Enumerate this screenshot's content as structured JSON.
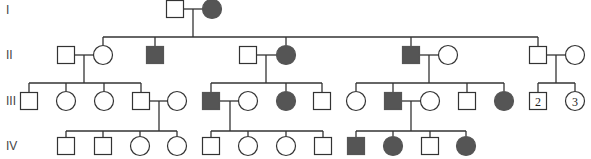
{
  "diagram": {
    "type": "pedigree",
    "colors": {
      "affected": "#555555",
      "unaffected": "#ffffff",
      "line": "#333333"
    },
    "generation_labels": [
      {
        "label": "I",
        "y": 10
      },
      {
        "label": "II",
        "y": 55
      },
      {
        "label": "III",
        "y": 101
      },
      {
        "label": "IV",
        "y": 146
      }
    ],
    "individuals": [
      {
        "id": "I-1",
        "sex": "male",
        "affected": false,
        "x": 175,
        "y": 9
      },
      {
        "id": "I-2",
        "sex": "female",
        "affected": true,
        "x": 212,
        "y": 9
      },
      {
        "id": "II-1",
        "sex": "male",
        "affected": false,
        "x": 66,
        "y": 55
      },
      {
        "id": "II-2",
        "sex": "female",
        "affected": false,
        "x": 103,
        "y": 55
      },
      {
        "id": "II-3",
        "sex": "male",
        "affected": true,
        "x": 155,
        "y": 55
      },
      {
        "id": "II-4",
        "sex": "male",
        "affected": false,
        "x": 248,
        "y": 55
      },
      {
        "id": "II-5",
        "sex": "female",
        "affected": true,
        "x": 286,
        "y": 55
      },
      {
        "id": "II-6",
        "sex": "male",
        "affected": true,
        "x": 411,
        "y": 55
      },
      {
        "id": "II-7",
        "sex": "female",
        "affected": false,
        "x": 448,
        "y": 55
      },
      {
        "id": "II-8",
        "sex": "male",
        "affected": false,
        "x": 538,
        "y": 55
      },
      {
        "id": "II-9",
        "sex": "female",
        "affected": false,
        "x": 575,
        "y": 55
      },
      {
        "id": "III-1",
        "sex": "male",
        "affected": false,
        "x": 29,
        "y": 101
      },
      {
        "id": "III-2",
        "sex": "female",
        "affected": false,
        "x": 66,
        "y": 101
      },
      {
        "id": "III-3",
        "sex": "female",
        "affected": false,
        "x": 104,
        "y": 101
      },
      {
        "id": "III-4",
        "sex": "male",
        "affected": false,
        "x": 141,
        "y": 101
      },
      {
        "id": "III-5",
        "sex": "female",
        "affected": false,
        "x": 177,
        "y": 101
      },
      {
        "id": "III-6",
        "sex": "male",
        "affected": true,
        "x": 211,
        "y": 101
      },
      {
        "id": "III-7",
        "sex": "female",
        "affected": false,
        "x": 248,
        "y": 101
      },
      {
        "id": "III-8",
        "sex": "female",
        "affected": true,
        "x": 286,
        "y": 101
      },
      {
        "id": "III-9",
        "sex": "male",
        "affected": false,
        "x": 322,
        "y": 101
      },
      {
        "id": "III-10",
        "sex": "female",
        "affected": false,
        "x": 356,
        "y": 101
      },
      {
        "id": "III-11",
        "sex": "male",
        "affected": true,
        "x": 393,
        "y": 101
      },
      {
        "id": "III-12",
        "sex": "female",
        "affected": false,
        "x": 430,
        "y": 101
      },
      {
        "id": "III-13",
        "sex": "male",
        "affected": false,
        "x": 467,
        "y": 101
      },
      {
        "id": "III-14",
        "sex": "female",
        "affected": true,
        "x": 504,
        "y": 101
      },
      {
        "id": "III-15",
        "sex": "male",
        "affected": false,
        "x": 538,
        "y": 101,
        "count": "2"
      },
      {
        "id": "III-16",
        "sex": "female",
        "affected": false,
        "x": 575,
        "y": 101,
        "count": "3"
      },
      {
        "id": "IV-1",
        "sex": "male",
        "affected": false,
        "x": 66,
        "y": 146
      },
      {
        "id": "IV-2",
        "sex": "male",
        "affected": false,
        "x": 103,
        "y": 146
      },
      {
        "id": "IV-3",
        "sex": "female",
        "affected": false,
        "x": 140,
        "y": 146
      },
      {
        "id": "IV-4",
        "sex": "female",
        "affected": false,
        "x": 177,
        "y": 146
      },
      {
        "id": "IV-5",
        "sex": "male",
        "affected": false,
        "x": 211,
        "y": 146
      },
      {
        "id": "IV-6",
        "sex": "female",
        "affected": false,
        "x": 248,
        "y": 146
      },
      {
        "id": "IV-7",
        "sex": "female",
        "affected": false,
        "x": 286,
        "y": 146
      },
      {
        "id": "IV-8",
        "sex": "male",
        "affected": false,
        "x": 323,
        "y": 146
      },
      {
        "id": "IV-9",
        "sex": "male",
        "affected": true,
        "x": 356,
        "y": 146
      },
      {
        "id": "IV-10",
        "sex": "female",
        "affected": true,
        "x": 393,
        "y": 146
      },
      {
        "id": "IV-11",
        "sex": "male",
        "affected": false,
        "x": 430,
        "y": 146
      },
      {
        "id": "IV-12",
        "sex": "female",
        "affected": true,
        "x": 466,
        "y": 146
      }
    ],
    "lines": [
      {
        "x1": 184,
        "y1": 9,
        "x2": 202,
        "y2": 9
      },
      {
        "x1": 193,
        "y1": 9,
        "x2": 193,
        "y2": 37
      },
      {
        "x1": 103,
        "y1": 37,
        "x2": 538,
        "y2": 37
      },
      {
        "x1": 103,
        "y1": 37,
        "x2": 103,
        "y2": 45
      },
      {
        "x1": 155,
        "y1": 37,
        "x2": 155,
        "y2": 46
      },
      {
        "x1": 286,
        "y1": 37,
        "x2": 286,
        "y2": 45
      },
      {
        "x1": 411,
        "y1": 37,
        "x2": 411,
        "y2": 46
      },
      {
        "x1": 538,
        "y1": 37,
        "x2": 538,
        "y2": 46
      },
      {
        "x1": 75,
        "y1": 55,
        "x2": 93,
        "y2": 55
      },
      {
        "x1": 84,
        "y1": 55,
        "x2": 84,
        "y2": 83
      },
      {
        "x1": 29,
        "y1": 83,
        "x2": 141,
        "y2": 83
      },
      {
        "x1": 29,
        "y1": 83,
        "x2": 29,
        "y2": 92
      },
      {
        "x1": 66,
        "y1": 83,
        "x2": 66,
        "y2": 91
      },
      {
        "x1": 104,
        "y1": 83,
        "x2": 104,
        "y2": 91
      },
      {
        "x1": 141,
        "y1": 83,
        "x2": 141,
        "y2": 92
      },
      {
        "x1": 257,
        "y1": 55,
        "x2": 276,
        "y2": 55
      },
      {
        "x1": 266,
        "y1": 55,
        "x2": 266,
        "y2": 83
      },
      {
        "x1": 211,
        "y1": 83,
        "x2": 322,
        "y2": 83
      },
      {
        "x1": 211,
        "y1": 83,
        "x2": 211,
        "y2": 92
      },
      {
        "x1": 286,
        "y1": 83,
        "x2": 286,
        "y2": 91
      },
      {
        "x1": 322,
        "y1": 83,
        "x2": 322,
        "y2": 92
      },
      {
        "x1": 420,
        "y1": 55,
        "x2": 438,
        "y2": 55
      },
      {
        "x1": 429,
        "y1": 55,
        "x2": 429,
        "y2": 83
      },
      {
        "x1": 356,
        "y1": 83,
        "x2": 504,
        "y2": 83
      },
      {
        "x1": 356,
        "y1": 83,
        "x2": 356,
        "y2": 91
      },
      {
        "x1": 393,
        "y1": 83,
        "x2": 393,
        "y2": 92
      },
      {
        "x1": 467,
        "y1": 83,
        "x2": 467,
        "y2": 92
      },
      {
        "x1": 504,
        "y1": 83,
        "x2": 504,
        "y2": 91
      },
      {
        "x1": 547,
        "y1": 55,
        "x2": 565,
        "y2": 55
      },
      {
        "x1": 556,
        "y1": 55,
        "x2": 556,
        "y2": 83
      },
      {
        "x1": 538,
        "y1": 83,
        "x2": 575,
        "y2": 83
      },
      {
        "x1": 538,
        "y1": 83,
        "x2": 538,
        "y2": 92
      },
      {
        "x1": 575,
        "y1": 83,
        "x2": 575,
        "y2": 91
      },
      {
        "x1": 150,
        "y1": 101,
        "x2": 167,
        "y2": 101
      },
      {
        "x1": 159,
        "y1": 101,
        "x2": 159,
        "y2": 131
      },
      {
        "x1": 66,
        "y1": 131,
        "x2": 177,
        "y2": 131
      },
      {
        "x1": 66,
        "y1": 131,
        "x2": 66,
        "y2": 137
      },
      {
        "x1": 103,
        "y1": 131,
        "x2": 103,
        "y2": 137
      },
      {
        "x1": 140,
        "y1": 131,
        "x2": 140,
        "y2": 136
      },
      {
        "x1": 177,
        "y1": 131,
        "x2": 177,
        "y2": 136
      },
      {
        "x1": 220,
        "y1": 101,
        "x2": 238,
        "y2": 101
      },
      {
        "x1": 230,
        "y1": 101,
        "x2": 230,
        "y2": 131
      },
      {
        "x1": 211,
        "y1": 131,
        "x2": 323,
        "y2": 131
      },
      {
        "x1": 211,
        "y1": 131,
        "x2": 211,
        "y2": 137
      },
      {
        "x1": 248,
        "y1": 131,
        "x2": 248,
        "y2": 136
      },
      {
        "x1": 286,
        "y1": 131,
        "x2": 286,
        "y2": 136
      },
      {
        "x1": 323,
        "y1": 131,
        "x2": 323,
        "y2": 137
      },
      {
        "x1": 402,
        "y1": 101,
        "x2": 420,
        "y2": 101
      },
      {
        "x1": 411,
        "y1": 101,
        "x2": 411,
        "y2": 131
      },
      {
        "x1": 356,
        "y1": 131,
        "x2": 466,
        "y2": 131
      },
      {
        "x1": 356,
        "y1": 131,
        "x2": 356,
        "y2": 137
      },
      {
        "x1": 393,
        "y1": 131,
        "x2": 393,
        "y2": 136
      },
      {
        "x1": 430,
        "y1": 131,
        "x2": 430,
        "y2": 137
      },
      {
        "x1": 466,
        "y1": 131,
        "x2": 466,
        "y2": 136
      }
    ]
  }
}
